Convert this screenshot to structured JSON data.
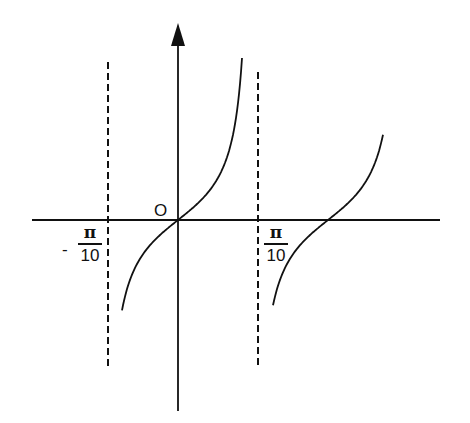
{
  "diagram": {
    "title": "",
    "origin_label": "O",
    "asymptotes": [
      {
        "name": "left",
        "sign": "-",
        "numerator": "π",
        "denominator": "10",
        "style": "dashed"
      },
      {
        "name": "right",
        "sign": "",
        "numerator": "π",
        "denominator": "10",
        "style": "dashed"
      }
    ],
    "axes": {
      "x_axis": {
        "arrow": false
      },
      "y_axis": {
        "arrow": true
      }
    },
    "colors": {
      "ink": "#111111",
      "background": "#ffffff"
    }
  }
}
